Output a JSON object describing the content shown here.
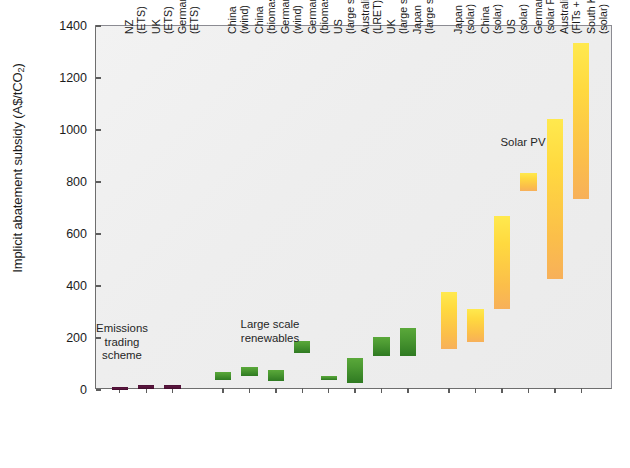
{
  "chart_data": {
    "type": "bar",
    "title": "",
    "xlabel": "",
    "ylabel": "Implicit abatement subsidy (A$/tCO",
    "ylabel_sub": "2",
    "ylabel_suffix": ")",
    "ylim": [
      0,
      1400
    ],
    "ytick_step": 200,
    "yticks": [
      "0",
      "200",
      "400",
      "600",
      "800",
      "1000",
      "1200",
      "1400"
    ],
    "grid": false,
    "legend": "none",
    "bar_style": "floating range bars (low-high)",
    "annotations": [
      {
        "text_line1": "Emissions",
        "text_line2": "trading",
        "text_line3": "scheme",
        "x": 122,
        "y": 322
      },
      {
        "text_line1": "Large scale",
        "text_line2": "renewables",
        "x": 270,
        "y": 318
      },
      {
        "text_line1": "Solar PV",
        "x": 523,
        "y": 136
      }
    ],
    "categories": [
      {
        "l1": "NZ",
        "l2": "(ETS)",
        "group": "ets",
        "low": 2,
        "high": 13
      },
      {
        "l1": "UK",
        "l2": "(ETS)",
        "group": "ets",
        "low": 4,
        "high": 20
      },
      {
        "l1": "Germany",
        "l2": "(ETS)",
        "group": "ets",
        "low": 4,
        "high": 20
      },
      {
        "l1": "China",
        "l2": "(wind)",
        "group": "large-scale-renewables",
        "low": 38,
        "high": 70
      },
      {
        "l1": "China",
        "l2": "(biomass)",
        "group": "large-scale-renewables",
        "low": 54,
        "high": 88
      },
      {
        "l1": "Germany",
        "l2": "(wind)",
        "group": "large-scale-renewables",
        "low": 35,
        "high": 77
      },
      {
        "l1": "Germany",
        "l2": "(biomass)",
        "group": "large-scale-renewables",
        "low": 142,
        "high": 188
      },
      {
        "l1": "US",
        "l2": "(large scale)",
        "group": "large-scale-renewables",
        "low": 38,
        "high": 54
      },
      {
        "l1": "Australia",
        "l2": "(LRET)",
        "group": "large-scale-renewables",
        "low": 27,
        "high": 123
      },
      {
        "l1": "UK",
        "l2": "(large scale)",
        "group": "large-scale-renewables",
        "low": 130,
        "high": 204
      },
      {
        "l1": "Japan",
        "l2": "(large scale)",
        "group": "large-scale-renewables",
        "low": 130,
        "high": 238
      },
      {
        "l1": "Japan",
        "l2": "(solar)",
        "group": "solar-pv",
        "low": 158,
        "high": 377
      },
      {
        "l1": "China",
        "l2": "(solar)",
        "group": "solar-pv",
        "low": 185,
        "high": 312
      },
      {
        "l1": "US",
        "l2": "(solar)",
        "group": "solar-pv",
        "low": 312,
        "high": 669
      },
      {
        "l1": "Germany",
        "l2": "(solar FITs)",
        "group": "solar-pv",
        "low": 765,
        "high": 835
      },
      {
        "l1": "Australia",
        "l2": "(FITs + SRET)",
        "group": "solar-pv",
        "low": 427,
        "high": 1042
      },
      {
        "l1": "South Korea",
        "l2": "(solar)",
        "group": "solar-pv",
        "low": 735,
        "high": 1335
      }
    ],
    "colors": {
      "ets": "#51123a",
      "large_scale_renewables": "#4c9a32",
      "solar_pv": "#ffd93f",
      "plot_background": "#eeeeee",
      "axis": "#5c5c5c",
      "text": "#1c1c1c"
    }
  }
}
